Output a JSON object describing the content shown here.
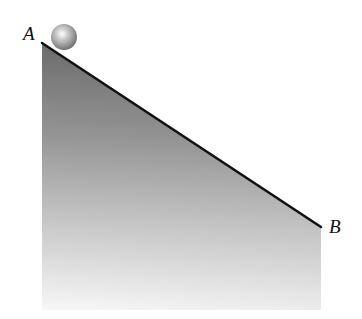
{
  "diagram": {
    "points": {
      "A": {
        "label": "A",
        "x": 42,
        "y": 43
      },
      "B": {
        "label": "B",
        "x": 321,
        "y": 227
      }
    },
    "ball": {
      "cx": 64,
      "cy": 37,
      "r": 13
    },
    "colors": {
      "incline_line": "#111111",
      "shade_top": "#7a7a7a",
      "shade_bottom": "#ffffff",
      "ball_highlight": "#ffffff",
      "ball_shadow": "#6e6e6e"
    }
  }
}
